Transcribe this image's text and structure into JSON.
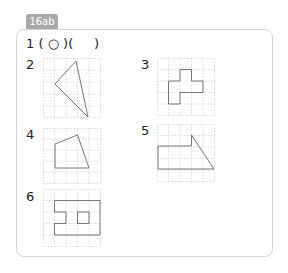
{
  "tag": {
    "label": "16ab",
    "color": "#a9a9a9"
  },
  "question1": {
    "number": "1",
    "text": "( ○ )(     )"
  },
  "figures": [
    {
      "number": "2",
      "shape": "triangle"
    },
    {
      "number": "3",
      "shape": "cross-like polygon"
    },
    {
      "number": "4",
      "shape": "quadrilateral"
    },
    {
      "number": "5",
      "shape": "pentagon (rectangle with triangle)"
    },
    {
      "number": "6",
      "shape": "frame with notch and inner square"
    }
  ],
  "colors": {
    "grid_line": "#d0d0d0",
    "shape_line": "#777777",
    "card_border": "#d6d6d6"
  }
}
